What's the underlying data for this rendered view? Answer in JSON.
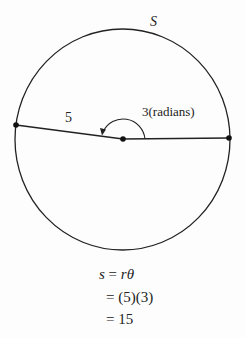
{
  "diagram": {
    "arc_label": "S",
    "radius_label": "5",
    "angle_label": "3(radians)",
    "colors": {
      "stroke": "#222222",
      "background": "#fdfdfd"
    },
    "circle": {
      "cx": 122.5,
      "cy": 139.5,
      "rx": 107.5,
      "ry": 110.5
    },
    "points": [
      {
        "name": "left-point",
        "x": 16,
        "y": 125
      },
      {
        "name": "center-point",
        "x": 123,
        "y": 139
      },
      {
        "name": "right-point",
        "x": 229,
        "y": 138
      }
    ]
  },
  "equation": {
    "line1": {
      "lhs": "s",
      "eq": " = ",
      "r": "r",
      "theta": "θ"
    },
    "line2": "= (5)(3)",
    "line3": "= 15"
  }
}
